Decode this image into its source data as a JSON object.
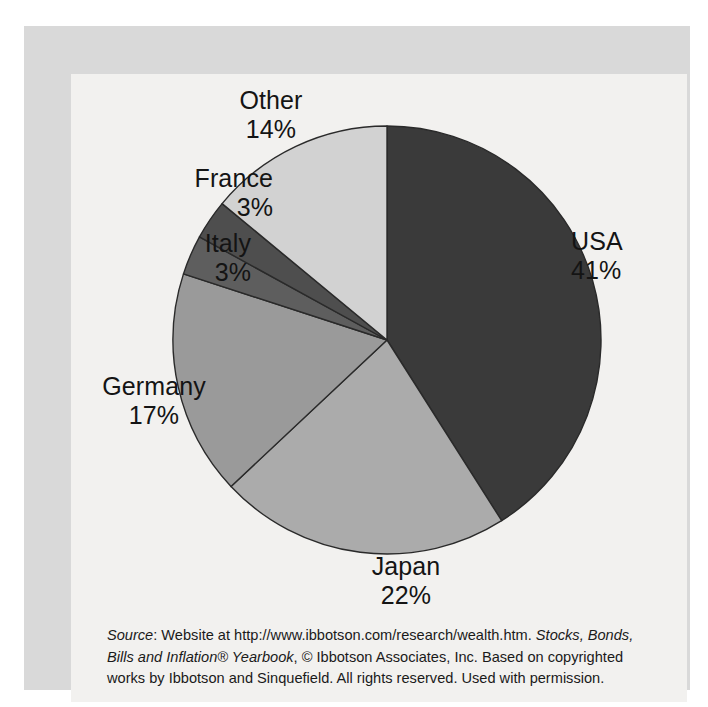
{
  "figure": {
    "background_color": "#f2f1ef",
    "mat_color": "#d9d9d9",
    "page_color": "#ffffff"
  },
  "chart_data": {
    "type": "pie",
    "title": "",
    "subtitle": "",
    "xlabel": "",
    "ylabel": "",
    "legend_position": "none",
    "grid": false,
    "start_angle_deg": 0,
    "direction": "clockwise",
    "categories": [
      "USA",
      "Japan",
      "Germany",
      "Italy",
      "France",
      "Other"
    ],
    "values": [
      41,
      22,
      17,
      3,
      3,
      14
    ],
    "value_unit": "%",
    "slice_colors": [
      "#3a3a3a",
      "#ababab",
      "#9a9a9a",
      "#5e5e5e",
      "#4e4e4e",
      "#d2d2d2"
    ],
    "slice_edge_color": "#2a2a2a",
    "labels": [
      {
        "name": "USA",
        "value": "41%",
        "color": "#3a3a3a"
      },
      {
        "name": "Japan",
        "value": "22%",
        "color": "#ababab"
      },
      {
        "name": "Germany",
        "value": "17%",
        "color": "#9a9a9a"
      },
      {
        "name": "Italy",
        "value": "3%",
        "color": "#5e5e5e"
      },
      {
        "name": "France",
        "value": "3%",
        "color": "#4e4e4e"
      },
      {
        "name": "Other",
        "value": "14%",
        "color": "#d2d2d2"
      }
    ]
  },
  "source_note": {
    "lead": "Source",
    "line1_after_lead": ": Website at http://www.ibbotson.com/research/wealth.htm. ",
    "italic_title_part1": "Stocks, Bonds,",
    "italic_title_part2": "Bills and Inflation® Yearbook",
    "rest": ", © Ibbotson Associates, Inc. Based on copyrighted works by Ibbotson and Sinquefield. All rights reserved. Used with permission.",
    "full_text": "Source: Website at http://www.ibbotson.com/research/wealth.htm. Stocks, Bonds, Bills and Inflation® Yearbook, © Ibbotson Associates, Inc. Based on copyrighted works by Ibbotson and Sinquefield. All rights reserved. Used with permission."
  }
}
